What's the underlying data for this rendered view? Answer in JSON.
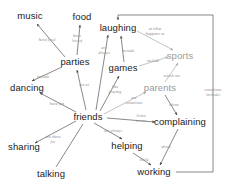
{
  "diagram": {
    "colors": {
      "node_text": "#1a1a1a",
      "node_text_faded": "#9b9b9b",
      "edge_label": "#8d8d8d",
      "edge_line": "#555555",
      "edge_line_faded": "#a9a9a9",
      "background": "#ffffff"
    },
    "nodes": [
      {
        "id": "music",
        "label": "music",
        "x": 30,
        "y": 16,
        "faded": false
      },
      {
        "id": "food",
        "label": "food",
        "x": 82,
        "y": 17,
        "faded": false
      },
      {
        "id": "laughing",
        "label": "laughing",
        "x": 118,
        "y": 28,
        "faded": false
      },
      {
        "id": "sports",
        "label": "sports",
        "x": 180,
        "y": 56,
        "faded": true
      },
      {
        "id": "parties",
        "label": "parties",
        "x": 75,
        "y": 62,
        "faded": false
      },
      {
        "id": "games",
        "label": "games",
        "x": 123,
        "y": 68,
        "faded": false
      },
      {
        "id": "dancing",
        "label": "dancing",
        "x": 27,
        "y": 88,
        "faded": false
      },
      {
        "id": "parents",
        "label": "parents",
        "x": 160,
        "y": 88,
        "faded": true
      },
      {
        "id": "friends",
        "label": "friends",
        "x": 88,
        "y": 117,
        "faded": false
      },
      {
        "id": "complaining",
        "label": "complaining",
        "x": 180,
        "y": 122,
        "faded": false
      },
      {
        "id": "sharing",
        "label": "sharing",
        "x": 24,
        "y": 147,
        "faded": false
      },
      {
        "id": "helping",
        "label": "helping",
        "x": 127,
        "y": 146,
        "faded": false
      },
      {
        "id": "talking",
        "label": "talking",
        "x": 51,
        "y": 174,
        "faded": false
      },
      {
        "id": "working",
        "label": "working",
        "x": 154,
        "y": 172,
        "faded": false
      }
    ],
    "edges": [
      {
        "from": "parties",
        "to": "music",
        "label": "have food",
        "lx": 47,
        "ly": 40,
        "faded": false
      },
      {
        "from": "parties",
        "to": "food",
        "label": "have\nlots of",
        "lx": 77,
        "ly": 39,
        "faded": false
      },
      {
        "from": "parties",
        "to": "dancing",
        "label": "include",
        "lx": 43,
        "ly": 77,
        "faded": false
      },
      {
        "from": "friends",
        "to": "parties",
        "label": "are at",
        "lx": 84,
        "ly": 85,
        "faded": false
      },
      {
        "from": "friends",
        "to": "dancing",
        "label": "have fun",
        "lx": 57,
        "ly": 104,
        "faded": false
      },
      {
        "from": "friends",
        "to": "laughing",
        "label": "are\nalways",
        "lx": 104,
        "ly": 51,
        "faded": false
      },
      {
        "from": "friends",
        "to": "games",
        "label": "like\nplaying",
        "lx": 115,
        "ly": 90,
        "faded": false
      },
      {
        "from": "games",
        "to": "laughing",
        "label": "include",
        "lx": 128,
        "ly": 51,
        "faded": false
      },
      {
        "from": "laughing",
        "to": "sports",
        "label": "at what\nhappens at",
        "lx": 155,
        "ly": 32,
        "faded": true
      },
      {
        "from": "games",
        "to": "sports",
        "label": "include",
        "lx": 153,
        "ly": 61,
        "faded": true
      },
      {
        "from": "parents",
        "to": "sports",
        "label": "watch our",
        "lx": 172,
        "ly": 76,
        "faded": true
      },
      {
        "from": "friends",
        "to": "parents",
        "label": "are\nsometimes",
        "lx": 134,
        "ly": 101,
        "faded": true
      },
      {
        "from": "friends",
        "to": "complaining",
        "label": "listen\nto our",
        "lx": 141,
        "ly": 119,
        "faded": false
      },
      {
        "from": "parents",
        "to": "complaining",
        "label": "about",
        "lx": 174,
        "ly": 105,
        "faded": false
      },
      {
        "from": "friends",
        "to": "sharing",
        "label": "are there\nfor",
        "lx": 53,
        "ly": 140,
        "faded": false
      },
      {
        "from": "friends",
        "to": "helping",
        "label": "are always",
        "lx": 113,
        "ly": 131,
        "faded": false
      },
      {
        "from": "helping",
        "to": "working",
        "label": "while",
        "lx": 144,
        "ly": 160,
        "faded": false
      },
      {
        "from": "complaining",
        "to": "working",
        "label": "about",
        "lx": 166,
        "ly": 147,
        "faded": false
      },
      {
        "from": "working",
        "to": "laughing",
        "label": "sometimes\nincludes",
        "lx": 213,
        "ly": 93,
        "faded": true
      },
      {
        "from": "talking",
        "to": "friends",
        "label": "",
        "lx": 0,
        "ly": 0,
        "faded": false
      }
    ]
  }
}
